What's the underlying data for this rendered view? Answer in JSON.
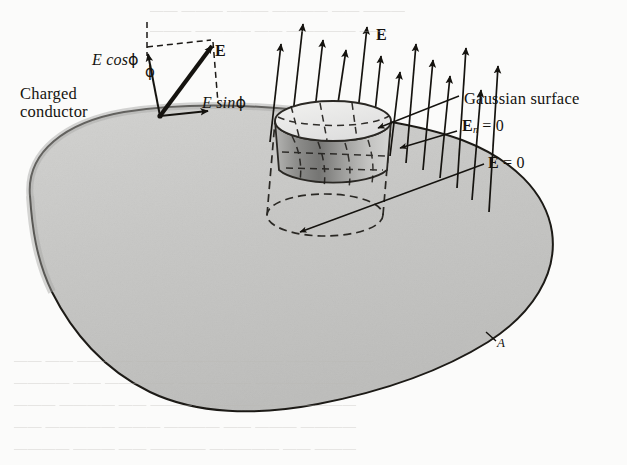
{
  "figure": {
    "kind": "physics-diagram",
    "background_color": "#fbfbfa",
    "conductor_fill": "#c8c8c6",
    "conductor_outline": "#1a1814",
    "ink_color": "#15130f"
  },
  "labels": {
    "charged_conductor_line1": "Charged",
    "charged_conductor_line2": "conductor",
    "e_cos_phi": "E cos",
    "e_sin_phi": "E sin",
    "phi_symbol": "ϕ",
    "phi_angle": "ϕ",
    "e_vector": "E",
    "e_field": "E",
    "gaussian_surface": "Gaussian surface",
    "en_zero_symbol": "E",
    "en_zero_subscript": "n",
    "en_zero_rest": "= 0",
    "e_zero_symbol": "E",
    "e_zero_rest": "= 0",
    "point_a": "A"
  },
  "bleed_through": {
    "top_line_1": "—— ——— ——— ———— —— ———",
    "top_line_2": "——— ———— —— ————— ——",
    "bottom_line_1": "—— —— ———— ——— ———— ——— —— ————",
    "bottom_line_2": "———— —— ————— ——— —— ———— ———",
    "bottom_line_3": "——— ———— —— ——— ————— —— ————",
    "bottom_line_4": "—— ————— ——— ———— —— ——— ————",
    "bottom_line_5": "———— ——— —— ———— ————— —— ———"
  },
  "geometry": {
    "field_arrow_count": 13,
    "conductor_path": "M 30 196 C 26 152 66 122 124 112 C 180 103 238 104 300 110 C 360 116 418 124 462 140 C 512 159 546 192 552 232 C 558 274 532 314 488 342 C 440 372 380 392 318 404 C 256 416 196 414 150 392 C 104 370 72 332 52 292 C 36 259 32 226 30 196 Z",
    "cylinder": {
      "top_ellipse_cx": 333,
      "top_ellipse_cy": 121,
      "top_rx": 58,
      "top_ry": 20,
      "bottom_ellipse_cx": 325,
      "bottom_ellipse_cy": 215,
      "bottom_rx": 58,
      "bottom_ry": 21
    }
  }
}
